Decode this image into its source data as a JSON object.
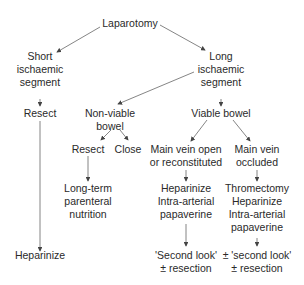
{
  "diagram": {
    "nodes": {
      "laparotomy": [
        "Laparotomy"
      ],
      "short_segment": [
        "Short",
        "ischaemic",
        "segment"
      ],
      "long_segment": [
        "Long",
        "ischaemic",
        "segment"
      ],
      "resect_short": [
        "Resect"
      ],
      "heparinize_short": [
        "Heparinize"
      ],
      "non_viable": [
        "Non-viable",
        "bowel"
      ],
      "viable": [
        "Viable bowel"
      ],
      "resect_nv": [
        "Resect"
      ],
      "close_nv": [
        "Close"
      ],
      "long_term": [
        "Long-term",
        "parenteral",
        "nutrition"
      ],
      "vein_open": [
        "Main vein open",
        "or reconstituted"
      ],
      "vein_occluded": [
        "Main vein",
        "occluded"
      ],
      "treat_open": [
        "Heparinize",
        "Intra-arterial",
        "papaverine"
      ],
      "treat_occluded": [
        "Thromectomy",
        "Heparinize",
        "Intra-arterial",
        "papaverine"
      ],
      "second_look_open": [
        "'Second look'",
        "± resection"
      ],
      "second_look_occluded": [
        "± 'second look'",
        "± resection"
      ]
    },
    "line_color": "#555555"
  }
}
